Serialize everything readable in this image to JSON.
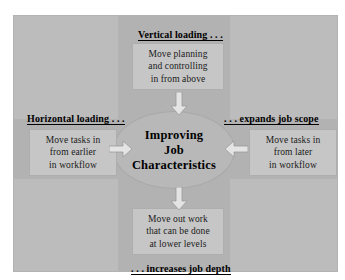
{
  "diagram": {
    "title_center": {
      "lines": [
        "Improving",
        "Job",
        "Characteristics"
      ]
    },
    "headings": {
      "top": "Vertical loading . . .",
      "left": "Horizontal loading . . .",
      "right": ". . . expands job scope",
      "bottom": ". . . increases job depth"
    },
    "boxes": {
      "top": {
        "lines": [
          "Move planning",
          "and controlling",
          "in from above"
        ]
      },
      "left": {
        "lines": [
          "Move tasks in",
          "from earlier",
          "in workflow"
        ]
      },
      "right": {
        "lines": [
          "Move tasks in",
          "from later",
          "in workflow"
        ]
      },
      "bottom": {
        "lines": [
          "Move out work",
          "that can be done",
          "at lower levels"
        ]
      }
    },
    "arrows": {
      "top": "arrow-down",
      "bottom": "arrow-down",
      "left": "arrow-right",
      "right": "arrow-left"
    },
    "colors": {
      "panel_background": "#bcbcbc",
      "band": "#b2b2b2",
      "ellipse": "#b8b8b8",
      "textbox": "#c6c6c6",
      "arrow_fill": "#e4e4e4",
      "arrow_stroke": "#9a9a9a",
      "text": "#000000",
      "page_background": "#ffffff"
    }
  }
}
